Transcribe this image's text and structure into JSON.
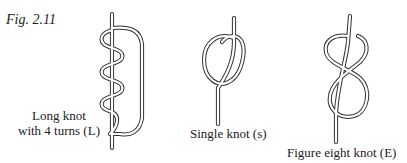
{
  "figure": {
    "label": "Fig. 2.11",
    "knots": [
      {
        "id": "L",
        "caption_lines": [
          "Long knot",
          "with 4 turns (L)"
        ]
      },
      {
        "id": "s",
        "caption_lines": [
          "Single knot (s)"
        ]
      },
      {
        "id": "E",
        "caption_lines": [
          "Figure eight knot (E)"
        ]
      }
    ]
  }
}
